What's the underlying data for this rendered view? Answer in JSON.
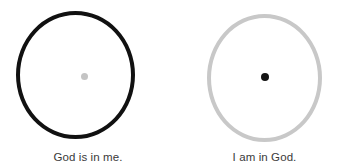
{
  "canvas": {
    "width": 353,
    "height": 168,
    "background_color": "#ffffff"
  },
  "diagram": {
    "type": "paired-concept-diagram",
    "panels": [
      {
        "id": "god-is-in-me",
        "caption": "God is in me.",
        "circle": {
          "role": "self-boundary",
          "stroke_color": "#111111",
          "stroke_width": 4.5,
          "fill": "none"
        },
        "center_dot": {
          "role": "god",
          "color": "#c4c4c4",
          "diameter": 7
        }
      },
      {
        "id": "i-am-in-god",
        "caption": "I am in God.",
        "circle": {
          "role": "god-boundary",
          "stroke_color": "#c8c8c8",
          "stroke_width": 4,
          "fill": "none"
        },
        "center_dot": {
          "role": "self",
          "color": "#141414",
          "diameter": 8
        }
      }
    ]
  }
}
